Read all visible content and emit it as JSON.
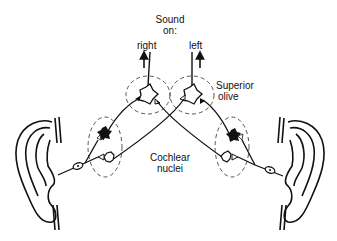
{
  "diagram": {
    "type": "auditory pathway schematic",
    "header": {
      "line1": "Sound",
      "line2": "on:"
    },
    "outputs": [
      {
        "label": "right",
        "arrow": "up"
      },
      {
        "label": "left",
        "arrow": "up"
      }
    ],
    "labels": {
      "superior_olive_line1": "Superior",
      "superior_olive_line2": "olive",
      "cochlear_line1": "Cochlear",
      "cochlear_line2": "nuclei"
    },
    "nodes": [
      {
        "id": "superior-olive-right",
        "group": "Superior olive",
        "side": "left-center"
      },
      {
        "id": "superior-olive-left",
        "group": "Superior olive",
        "side": "right-center"
      },
      {
        "id": "cochlear-nucleus-left",
        "group": "Cochlear nuclei",
        "side": "left",
        "neurons": [
          "excitatory-filled",
          "inhibitory-open"
        ]
      },
      {
        "id": "cochlear-nucleus-right",
        "group": "Cochlear nuclei",
        "side": "right",
        "neurons": [
          "excitatory-filled",
          "inhibitory-open"
        ]
      },
      {
        "id": "ear-left",
        "group": "Ear"
      },
      {
        "id": "ear-right",
        "group": "Ear"
      }
    ],
    "colors": {
      "ink": "#111111",
      "background": "#ffffff",
      "dashed_circle": "#555555"
    }
  }
}
